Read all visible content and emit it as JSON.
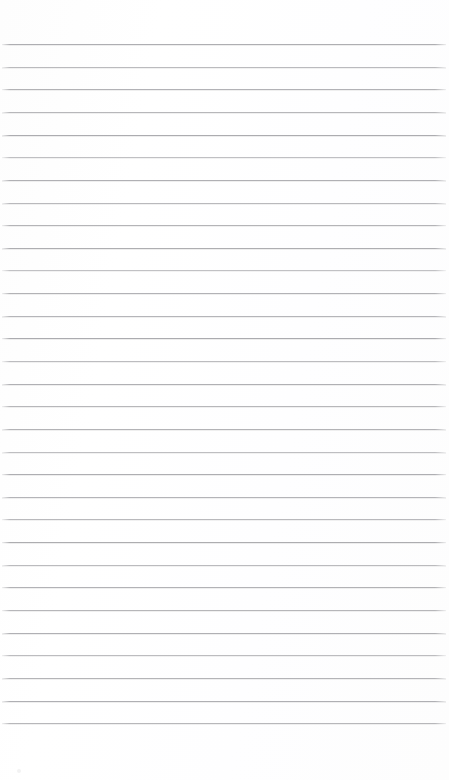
{
  "page": {
    "kind": "scanned-blank-ruled-notebook-page",
    "width": 449,
    "height": 780,
    "background_color": "#fefefe",
    "text_content": "",
    "has_text": false
  },
  "ruling": {
    "line_color": "#a8a8ac",
    "halo_color": "#dededf",
    "line_thickness_px": 1,
    "line_count": 31,
    "spacing_px": 22.64,
    "first_line_y": 44,
    "last_line_y": 723,
    "line_start_x": 2,
    "line_end_x": 446,
    "line_y_positions": [
      44,
      66.6,
      89.3,
      111.9,
      134.6,
      157.2,
      179.8,
      202.5,
      225.1,
      247.8,
      270.4,
      293.0,
      315.7,
      338.3,
      361.0,
      383.6,
      406.2,
      428.9,
      451.5,
      474.2,
      496.8,
      519.4,
      542.1,
      564.7,
      587.4,
      610.0,
      632.6,
      655.3,
      677.9,
      700.6,
      723.2
    ],
    "line_opacities": [
      0.92,
      0.78,
      0.88,
      0.82,
      0.95,
      0.72,
      0.9,
      0.8,
      0.86,
      0.93,
      0.7,
      0.88,
      0.84,
      0.96,
      0.76,
      0.9,
      0.82,
      0.87,
      0.74,
      0.92,
      0.85,
      0.8,
      0.94,
      0.78,
      0.88,
      0.83,
      0.9,
      0.76,
      0.86,
      0.91,
      0.82
    ]
  },
  "margins": {
    "top_margin_px": 44,
    "bottom_margin_px": 57,
    "left_margin_px": 2,
    "right_margin_px": 3
  },
  "artifacts": {
    "speck": {
      "x": 17,
      "y": 769,
      "color": "#f2f2f3"
    }
  }
}
